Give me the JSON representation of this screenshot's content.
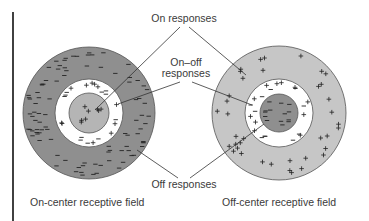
{
  "diagram": {
    "labels": {
      "on_responses": "On responses",
      "on_off_line1": "On–off",
      "on_off_line2": "responses",
      "off_responses": "Off responses"
    },
    "fields": [
      {
        "id": "on-center",
        "caption": "On-center receptive field",
        "center_sign": "+",
        "ring_signs": "+/−",
        "surround_sign": "−",
        "center_color": "#b5b5b5",
        "ring_color": "#ffffff",
        "surround_color": "#8f8f8f"
      },
      {
        "id": "off-center",
        "caption": "Off-center receptive field",
        "center_sign": "−",
        "ring_signs": "+/−",
        "surround_sign": "+",
        "center_color": "#8f8f8f",
        "ring_color": "#ffffff",
        "surround_color": "#c6c6c6"
      }
    ]
  }
}
